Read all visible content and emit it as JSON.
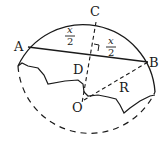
{
  "diagram": {
    "type": "geometry",
    "stroke_color": "#1a1a1a",
    "background": "#ffffff",
    "points": {
      "A": {
        "label": "A"
      },
      "B": {
        "label": "B"
      },
      "C": {
        "label": "C"
      },
      "D": {
        "label": "D"
      },
      "O": {
        "label": "O"
      }
    },
    "segment_labels": {
      "left_half": {
        "numerator": "x",
        "denominator": "2"
      },
      "right_half": {
        "numerator": "x",
        "denominator": "2"
      },
      "radius": "R"
    }
  }
}
